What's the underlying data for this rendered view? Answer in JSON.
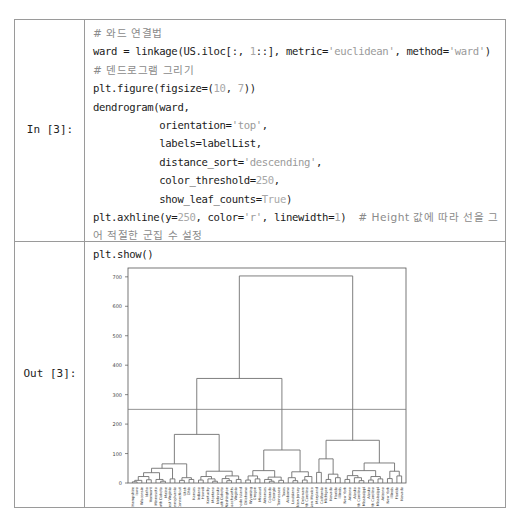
{
  "cells": {
    "input": {
      "prompt": "In [3]:",
      "lines": [
        [
          {
            "t": "# 와드 연결법",
            "c": "cm"
          }
        ],
        [
          {
            "t": "ward = linkage(US.iloc[:, ",
            "c": ""
          },
          {
            "t": "1",
            "c": "nm"
          },
          {
            "t": "::], metric=",
            "c": ""
          },
          {
            "t": "'euclidean'",
            "c": "st"
          },
          {
            "t": ", method=",
            "c": ""
          },
          {
            "t": "'ward'",
            "c": "st"
          },
          {
            "t": ")",
            "c": ""
          }
        ],
        [
          {
            "t": "# 덴드로그램 그리기",
            "c": "cm"
          }
        ],
        [
          {
            "t": "plt.figure(figsize=(",
            "c": ""
          },
          {
            "t": "10",
            "c": "nm"
          },
          {
            "t": ", ",
            "c": ""
          },
          {
            "t": "7",
            "c": "nm"
          },
          {
            "t": "))",
            "c": ""
          }
        ],
        [
          {
            "t": "dendrogram(ward,",
            "c": ""
          }
        ],
        [
          {
            "t": "           orientation=",
            "c": ""
          },
          {
            "t": "'top'",
            "c": "st"
          },
          {
            "t": ",",
            "c": ""
          }
        ],
        [
          {
            "t": "           labels=labelList,",
            "c": ""
          }
        ],
        [
          {
            "t": "           distance_sort=",
            "c": ""
          },
          {
            "t": "'descending'",
            "c": "st"
          },
          {
            "t": ",",
            "c": ""
          }
        ],
        [
          {
            "t": "           color_threshold=",
            "c": ""
          },
          {
            "t": "250",
            "c": "nm"
          },
          {
            "t": ",",
            "c": ""
          }
        ],
        [
          {
            "t": "           show_leaf_counts=",
            "c": ""
          },
          {
            "t": "True",
            "c": "nm"
          },
          {
            "t": ")",
            "c": ""
          }
        ],
        [
          {
            "t": "plt.axhline(y=",
            "c": ""
          },
          {
            "t": "250",
            "c": "nm"
          },
          {
            "t": ", color=",
            "c": ""
          },
          {
            "t": "'r'",
            "c": "st"
          },
          {
            "t": ", linewidth=",
            "c": ""
          },
          {
            "t": "1",
            "c": "nm"
          },
          {
            "t": ")  ",
            "c": ""
          },
          {
            "t": "# Height 값에 따라 선을 그",
            "c": "cm"
          }
        ],
        [
          {
            "t": "어 적절한 군집 수 설정",
            "c": "cm"
          }
        ],
        [
          {
            "t": "plt.show()",
            "c": ""
          }
        ]
      ]
    },
    "output": {
      "prompt": "Out [3]:"
    }
  },
  "chart_data": {
    "type": "dendrogram",
    "title": "",
    "xlabel": "",
    "ylabel": "",
    "ylim": [
      0,
      730
    ],
    "yticks": [
      0,
      100,
      200,
      300,
      400,
      500,
      600,
      700
    ],
    "threshold_line": {
      "y": 250,
      "color": "r"
    },
    "color_threshold": 250,
    "leaves": [
      "New Hampshire",
      "Iowa",
      "Wisconsin",
      "Idaho",
      "Vermont",
      "Minnesota",
      "North Dakota",
      "Maine",
      "West Virginia",
      "Pennsylvania",
      "Connecticut",
      "Utah",
      "Ohio",
      "Kansas",
      "Indiana",
      "Hawaii",
      "Kentucky",
      "Montana",
      "Nebraska",
      "South Dakota",
      "Washington",
      "Massachusetts",
      "Virginia",
      "Rhode Island",
      "Oklahoma",
      "Wyoming",
      "Oregon",
      "Missouri",
      "Arkansas",
      "Colorado",
      "Georgia",
      "Tennessee",
      "Texas",
      "Alabama",
      "Louisiana",
      "New Jersey",
      "Delaware",
      "North Carolina",
      "New Mexico",
      "Maryland",
      "California",
      "Michigan",
      "Nevada",
      "Florida",
      "Illinois",
      "New York",
      "Arizona",
      "Alaska",
      "South Carolina",
      "Mississippi"
    ],
    "tree": {
      "h": 703,
      "c": [
        {
          "h": 355,
          "c": [
            {
              "h": 165,
              "c": [
                {
                  "h": 65,
                  "c": [
                    {
                      "h": 50,
                      "c": [
                        {
                          "h": 35,
                          "c": [
                            {
                              "h": 22,
                              "c": [
                                {
                                  "h": 9,
                                  "c": [
                                    {
                                      "h": 4,
                                      "c": [
                                        0,
                                        1
                                      ]
                                    },
                                    2
                                  ]
                                },
                                {
                                  "h": 11,
                                  "c": [
                                    3,
                                    4
                                  ]
                                }
                              ]
                            },
                            {
                              "h": 12,
                              "c": [
                                5,
                                {
                                  "h": 6,
                                  "c": [
                                    6,
                                    7
                                  ]
                                }
                              ]
                            }
                          ]
                        },
                        {
                          "h": 14,
                          "c": [
                            8,
                            9
                          ]
                        }
                      ]
                    },
                    {
                      "h": 18,
                      "c": [
                        {
                          "h": 9,
                          "c": [
                            10,
                            11
                          ]
                        },
                        {
                          "h": 12,
                          "c": [
                            12,
                            13
                          ]
                        }
                      ]
                    }
                  ]
                },
                {
                  "h": 40,
                  "c": [
                    {
                      "h": 22,
                      "c": [
                        {
                          "h": 10,
                          "c": [
                            14,
                            15
                          ]
                        },
                        {
                          "h": 14,
                          "c": [
                            16,
                            {
                              "h": 6,
                              "c": [
                                17,
                                18
                              ]
                            }
                          ]
                        }
                      ]
                    },
                    {
                      "h": 24,
                      "c": [
                        {
                          "h": 15,
                          "c": [
                            19,
                            {
                              "h": 8,
                              "c": [
                                20,
                                21
                              ]
                            }
                          ]
                        },
                        {
                          "h": 12,
                          "c": [
                            22,
                            23
                          ]
                        }
                      ]
                    }
                  ]
                }
              ]
            },
            {
              "h": 112,
              "c": [
                {
                  "h": 42,
                  "c": [
                    {
                      "h": 24,
                      "c": [
                        {
                          "h": 10,
                          "c": [
                            24,
                            25
                          ]
                        },
                        {
                          "h": 14,
                          "c": [
                            26,
                            27
                          ]
                        }
                      ]
                    },
                    {
                      "h": 20,
                      "c": [
                        {
                          "h": 12,
                          "c": [
                            28,
                            {
                              "h": 6,
                              "c": [
                                29,
                                30
                              ]
                            }
                          ]
                        },
                        {
                          "h": 9,
                          "c": [
                            31,
                            32
                          ]
                        }
                      ]
                    }
                  ]
                },
                {
                  "h": 38,
                  "c": [
                    {
                      "h": 18,
                      "c": [
                        33,
                        {
                          "h": 8,
                          "c": [
                            34,
                            35
                          ]
                        }
                      ]
                    },
                    {
                      "h": 22,
                      "c": [
                        {
                          "h": 10,
                          "c": [
                            36,
                            37
                          ]
                        },
                        38
                      ]
                    }
                  ]
                }
              ]
            }
          ]
        },
        {
          "h": 145,
          "c": [
            {
              "h": 82,
              "c": [
                {
                  "h": 36,
                  "c": [
                    39,
                    40
                  ]
                },
                {
                  "h": 30,
                  "c": [
                    {
                      "h": 12,
                      "c": [
                        41,
                        42
                      ]
                    },
                    {
                      "h": 18,
                      "c": [
                        43,
                        44
                      ]
                    }
                  ]
                }
              ]
            },
            {
              "h": 68,
              "c": [
                {
                  "h": 42,
                  "c": [
                    {
                      "h": 25,
                      "c": [
                        {
                          "h": 12,
                          "c": [
                            45,
                            46
                          ]
                        },
                        {
                          "h": 18,
                          "c": [
                            47,
                            {
                              "h": 8,
                              "c": [
                                48,
                                49
                              ]
                            }
                          ]
                        }
                      ]
                    },
                    {
                      "h": 22,
                      "c": [
                        {
                          "h": 10,
                          "c": [
                            50,
                            51
                          ]
                        },
                        {
                          "h": 14,
                          "c": [
                            52,
                            53
                          ]
                        }
                      ]
                    }
                  ]
                },
                {
                  "h": 40,
                  "c": [
                    {
                      "h": 15,
                      "c": [
                        54,
                        55
                      ]
                    },
                    {
                      "h": 24,
                      "c": [
                        56,
                        57
                      ]
                    }
                  ]
                }
              ]
            }
          ]
        }
      ]
    },
    "leaf_count": 58,
    "extra_leaves": [
      "Alaska",
      "South Carolina",
      "Mississippi",
      "Arizona",
      "New York",
      "Illinois",
      "Florida",
      "Nevada"
    ]
  }
}
